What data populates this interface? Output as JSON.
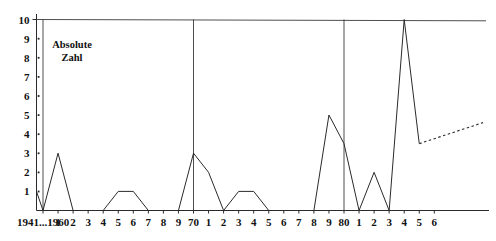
{
  "chart_data": {
    "type": "line",
    "title": "",
    "subtitle": "",
    "xlabel": "",
    "ylabel": "Absolute Zahl",
    "ylim": [
      0,
      10
    ],
    "yticks": [
      0,
      1,
      2,
      3,
      4,
      5,
      6,
      7,
      8,
      9,
      10
    ],
    "ytick_labels": [
      "",
      "1",
      "2",
      "3",
      "4",
      "5",
      "6",
      "7",
      "8",
      "9",
      "10"
    ],
    "grid": "vertical gridlines at 1960, 70 and 80; horizontal rule at y=10",
    "legend": "none",
    "annotations": [
      "Absolute Zahl"
    ],
    "xtick_labels": [
      "1941...1960",
      "1",
      "2",
      "3",
      "4",
      "5",
      "6",
      "7",
      "8",
      "9",
      "70",
      "1",
      "2",
      "3",
      "4",
      "5",
      "6",
      "7",
      "8",
      "9",
      "80",
      "1",
      "2",
      "3",
      "4",
      "5",
      "6"
    ],
    "categories": [
      "1941...1960",
      "1961",
      "1962",
      "1963",
      "1964",
      "1965",
      "1966",
      "1967",
      "1968",
      "1969",
      "1970",
      "1971",
      "1972",
      "1973",
      "1974",
      "1975",
      "1976",
      "1977",
      "1978",
      "1979",
      "1980",
      "1981",
      "1982",
      "1983",
      "1984",
      "1985",
      "1986"
    ],
    "x_start_label": "1941",
    "values": [
      0,
      3,
      0,
      0,
      0,
      1,
      1,
      0,
      0,
      0,
      3,
      2,
      0,
      1,
      1,
      0,
      0,
      0,
      0,
      5,
      3.5,
      0,
      2,
      0,
      10,
      3.5,
      null
    ],
    "lead_in_point": {
      "label": "1941",
      "value": 1
    },
    "projection": {
      "style": "dashed",
      "from": {
        "category": "1985",
        "value": 3.5
      },
      "to": {
        "category": "1986+",
        "value": 4.6
      }
    },
    "gridline_categories": [
      "1941...1960",
      "1970",
      "1980"
    ],
    "colors": {
      "line": "#2a2a2a",
      "axis": "#2a2a2a",
      "grid": "#3a3a3a",
      "text": "#111111",
      "background": "#ffffff"
    }
  }
}
